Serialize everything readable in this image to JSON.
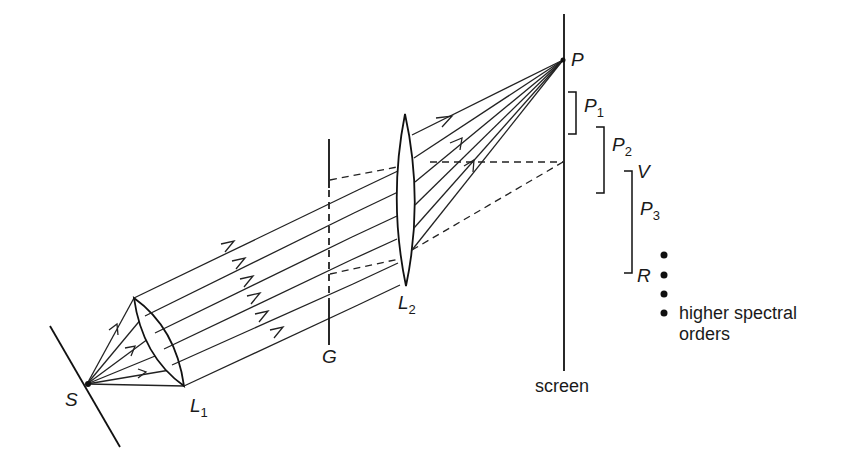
{
  "diagram": {
    "labels": {
      "source": "S",
      "lens1": "L",
      "lens1_sub": "1",
      "grating": "G",
      "lens2": "L",
      "lens2_sub": "2",
      "screen": "screen",
      "point": "P",
      "order1": "P",
      "order1_sub": "1",
      "order2": "P",
      "order2_sub": "2",
      "order3": "P",
      "order3_sub": "3",
      "violet": "V",
      "red": "R",
      "higher_orders_line1": "higher spectral",
      "higher_orders_line2": "orders"
    },
    "colors": {
      "ink": "#1a1a1a",
      "background": "#ffffff"
    }
  }
}
